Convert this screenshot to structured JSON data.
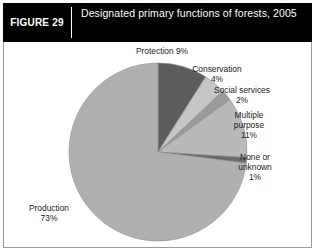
{
  "header": {
    "figure_number": "FIGURE 29",
    "title": "Designated primary functions of forests, 2005"
  },
  "labels": {
    "protection": "Protection 9%",
    "conservation_name": "Conservation",
    "conservation_value": "4%",
    "social_name": "Social services",
    "social_value": "2%",
    "multiple_name_1": "Multiple",
    "multiple_name_2": "purpose",
    "multiple_value": "11%",
    "none_name_1": "None or",
    "none_name_2": "unknown",
    "none_value": "1%",
    "production_name": "Production",
    "production_value": "73%"
  },
  "colors": {
    "header_bg": "#000000",
    "header_text": "#ffffff",
    "frame": "#9b9b9b",
    "plot_bg": "#ffffff",
    "label_text": "#1b1b1b",
    "protection": "#5d5d5d",
    "conservation": "#c6c6c6",
    "social_services": "#9a9a9a",
    "multiple_purpose": "#b9b9b9",
    "none_or_unknown": "#6a6a6a",
    "production": "#b0b0b0",
    "slice_outline": "#8f8f8f"
  },
  "chart_data": {
    "type": "pie",
    "title": "Designated primary functions of forests, 2005",
    "xlabel": "",
    "ylabel": "",
    "unit": "percent",
    "start_angle_deg": 0,
    "direction": "clockwise",
    "legend": "none (direct labels)",
    "grid": false,
    "categories": [
      "Protection",
      "Conservation",
      "Social services",
      "Multiple purpose",
      "None or unknown",
      "Production"
    ],
    "values": [
      9,
      4,
      2,
      11,
      1,
      73
    ],
    "slices": [
      {
        "label": "Protection",
        "value": 9,
        "display": "9%",
        "color": "#5d5d5d"
      },
      {
        "label": "Conservation",
        "value": 4,
        "display": "4%",
        "color": "#c6c6c6"
      },
      {
        "label": "Social services",
        "value": 2,
        "display": "2%",
        "color": "#9a9a9a"
      },
      {
        "label": "Multiple purpose",
        "value": 11,
        "display": "11%",
        "color": "#b9b9b9"
      },
      {
        "label": "None or unknown",
        "value": 1,
        "display": "1%",
        "color": "#6a6a6a"
      },
      {
        "label": "Production",
        "value": 73,
        "display": "73%",
        "color": "#b0b0b0"
      }
    ],
    "geometry": {
      "center_x": 154,
      "center_y": 110,
      "radius": 89
    }
  }
}
